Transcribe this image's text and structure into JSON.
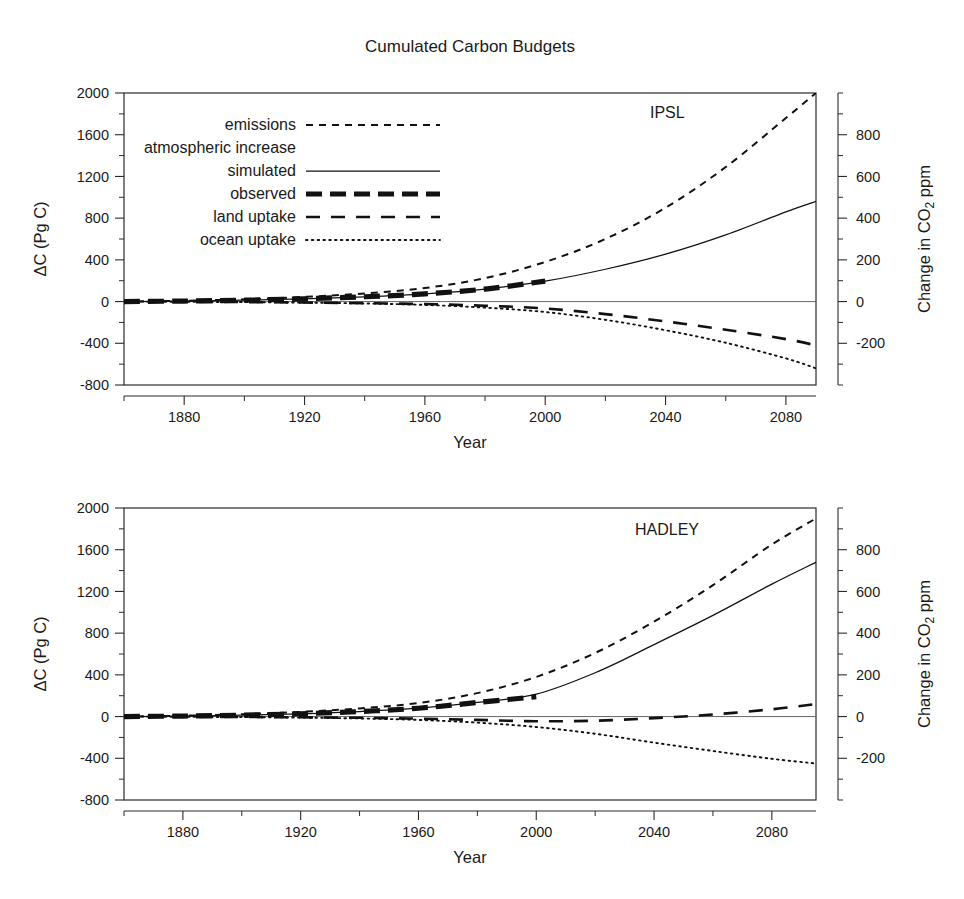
{
  "figure": {
    "title": "Cumulated Carbon Budgets",
    "width": 964,
    "height": 899
  },
  "legend": {
    "entries": [
      {
        "label": "emissions",
        "style": "short-dash",
        "indent": 0
      },
      {
        "label": "atmospheric increase",
        "style": "none",
        "indent": 0
      },
      {
        "label": "simulated",
        "style": "solid",
        "indent": 1
      },
      {
        "label": "observed",
        "style": "thick-dash",
        "indent": 1
      },
      {
        "label": "land uptake",
        "style": "long-dash",
        "indent": 0
      },
      {
        "label": "ocean uptake",
        "style": "dotted",
        "indent": 0
      }
    ]
  },
  "axes": {
    "xlabel": "Year",
    "ylabel_left": "ΔC  (Pg C)",
    "ylabel_right_parts": {
      "pre": "Change in CO",
      "sub": "2",
      "post": " ppm"
    },
    "x_ticks": [
      1880,
      1920,
      1960,
      2000,
      2040,
      2080
    ],
    "x_minor_step": 20,
    "x_range": [
      1860,
      2095
    ],
    "y_left_ticks": [
      2000,
      1600,
      1200,
      800,
      400,
      0,
      -400,
      -800
    ],
    "y_left_range": [
      -800,
      2000
    ],
    "y_left_minor_step": 200,
    "y_right_ticks": [
      800,
      600,
      400,
      200,
      0,
      -200
    ],
    "y_right_range": [
      -400,
      1000
    ],
    "y_right_minor_step": 100,
    "conversion_note": "Pg C to ppm scale factor 2.123"
  },
  "chart_data": [
    {
      "type": "line",
      "panel_label": "IPSL",
      "title": "Cumulated Carbon Budgets",
      "xlabel": "Year",
      "ylabel": "ΔC  (Pg C)",
      "ylabel_secondary": "Change in CO2 ppm",
      "xlim": [
        1860,
        2090
      ],
      "ylim": [
        -800,
        2000
      ],
      "ylim_secondary": [
        -400,
        1000
      ],
      "grid": false,
      "legend_position": "upper-left",
      "x": [
        1860,
        1880,
        1900,
        1920,
        1940,
        1960,
        1980,
        2000,
        2020,
        2040,
        2060,
        2080,
        2090
      ],
      "series": [
        {
          "name": "emissions",
          "style": "short-dash",
          "values": [
            0,
            8,
            22,
            45,
            78,
            130,
            225,
            380,
            600,
            900,
            1290,
            1760,
            2000
          ]
        },
        {
          "name": "atmospheric increase simulated",
          "style": "solid",
          "values": [
            0,
            5,
            13,
            27,
            46,
            74,
            120,
            196,
            310,
            455,
            640,
            860,
            960
          ]
        },
        {
          "name": "atmospheric increase observed",
          "style": "thick-dash",
          "x_end": 2000,
          "values": [
            0,
            5,
            13,
            27,
            46,
            74,
            120,
            196
          ]
        },
        {
          "name": "land uptake",
          "style": "long-dash",
          "values": [
            0,
            -2,
            -5,
            -9,
            -15,
            -24,
            -40,
            -66,
            -120,
            -190,
            -270,
            -360,
            -420
          ]
        },
        {
          "name": "ocean uptake",
          "style": "dotted",
          "values": [
            0,
            -2,
            -5,
            -10,
            -18,
            -32,
            -58,
            -100,
            -175,
            -275,
            -395,
            -545,
            -640
          ]
        }
      ]
    },
    {
      "type": "line",
      "panel_label": "HADLEY",
      "title": "Cumulated Carbon Budgets",
      "xlabel": "Year",
      "ylabel": "ΔC  (Pg C)",
      "ylabel_secondary": "Change in CO2 ppm",
      "xlim": [
        1860,
        2095
      ],
      "ylim": [
        -800,
        2000
      ],
      "ylim_secondary": [
        -400,
        1000
      ],
      "grid": false,
      "legend_position": "none",
      "x": [
        1860,
        1880,
        1900,
        1920,
        1940,
        1960,
        1980,
        2000,
        2020,
        2040,
        2060,
        2080,
        2095
      ],
      "series": [
        {
          "name": "emissions",
          "style": "short-dash",
          "values": [
            0,
            8,
            22,
            45,
            78,
            130,
            225,
            380,
            610,
            910,
            1260,
            1650,
            1900
          ]
        },
        {
          "name": "atmospheric increase simulated",
          "style": "solid",
          "values": [
            0,
            5,
            13,
            27,
            48,
            80,
            135,
            215,
            420,
            690,
            970,
            1270,
            1480
          ]
        },
        {
          "name": "atmospheric increase observed",
          "style": "thick-dash",
          "x_end": 2000,
          "values": [
            0,
            5,
            13,
            27,
            48,
            80,
            135,
            190
          ]
        },
        {
          "name": "land uptake",
          "style": "long-dash",
          "values": [
            0,
            -2,
            -4,
            -7,
            -12,
            -20,
            -32,
            -45,
            -40,
            -15,
            20,
            70,
            120
          ]
        },
        {
          "name": "ocean uptake",
          "style": "dotted",
          "values": [
            0,
            -2,
            -5,
            -10,
            -18,
            -32,
            -58,
            -100,
            -165,
            -250,
            -330,
            -405,
            -450
          ]
        }
      ]
    }
  ]
}
